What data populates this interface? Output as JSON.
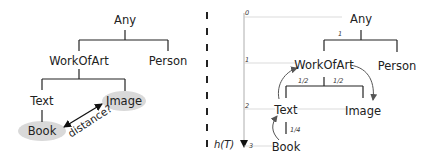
{
  "left_panel": {
    "nodes": {
      "any": "Any",
      "work_of_art": "WorkOfArt",
      "person": "Person",
      "text": "Text",
      "image": "Image",
      "book": "Book"
    },
    "question_label": "distance?",
    "highlight_color": "#d9d9d9"
  },
  "right_panel": {
    "nodes": {
      "any": "Any",
      "work_of_art": "WorkOfArt",
      "person": "Person",
      "text": "Text",
      "image": "Image",
      "book": "Book"
    },
    "edge_weights": {
      "any_children": "1",
      "workofart_text": "1/2",
      "workofart_image": "1/2",
      "text_book": "1/4"
    },
    "depth_levels": [
      "0",
      "1",
      "2",
      "3"
    ],
    "axis_label": "h(T)"
  },
  "divider_color": "#222222",
  "arrow_color": "#555555"
}
